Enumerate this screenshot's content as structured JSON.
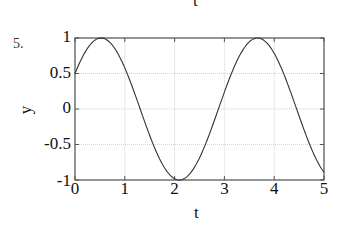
{
  "page": {
    "top_clipped_label": "t",
    "problem_number": "5."
  },
  "chart_data": {
    "type": "line",
    "title": "",
    "xlabel": "t",
    "ylabel": "y",
    "xlim": [
      0,
      5
    ],
    "ylim": [
      -1,
      1
    ],
    "grid": true,
    "xticks": [
      "0",
      "1",
      "2",
      "3",
      "4",
      "5"
    ],
    "yticks": [
      "1",
      "0.5",
      "0",
      "-0.5",
      "-1"
    ],
    "function": "y = sin(2t + pi/6)",
    "series": [
      {
        "name": "y(t)",
        "color": "#333333",
        "x": [
          0,
          0.25,
          0.5236,
          0.75,
          1.0,
          1.25,
          1.5,
          1.75,
          2.0944,
          2.25,
          2.5,
          2.75,
          3.0,
          3.25,
          3.6652,
          3.75,
          4.0,
          4.25,
          4.5,
          4.75,
          5.0
        ],
        "values": [
          0.5,
          0.866,
          1.0,
          0.966,
          0.705,
          0.328,
          -0.098,
          -0.502,
          -1.0,
          -0.953,
          -0.751,
          -0.405,
          0.016,
          0.438,
          1.0,
          0.985,
          0.815,
          0.496,
          0.055,
          -0.375,
          -0.876
        ]
      }
    ]
  }
}
